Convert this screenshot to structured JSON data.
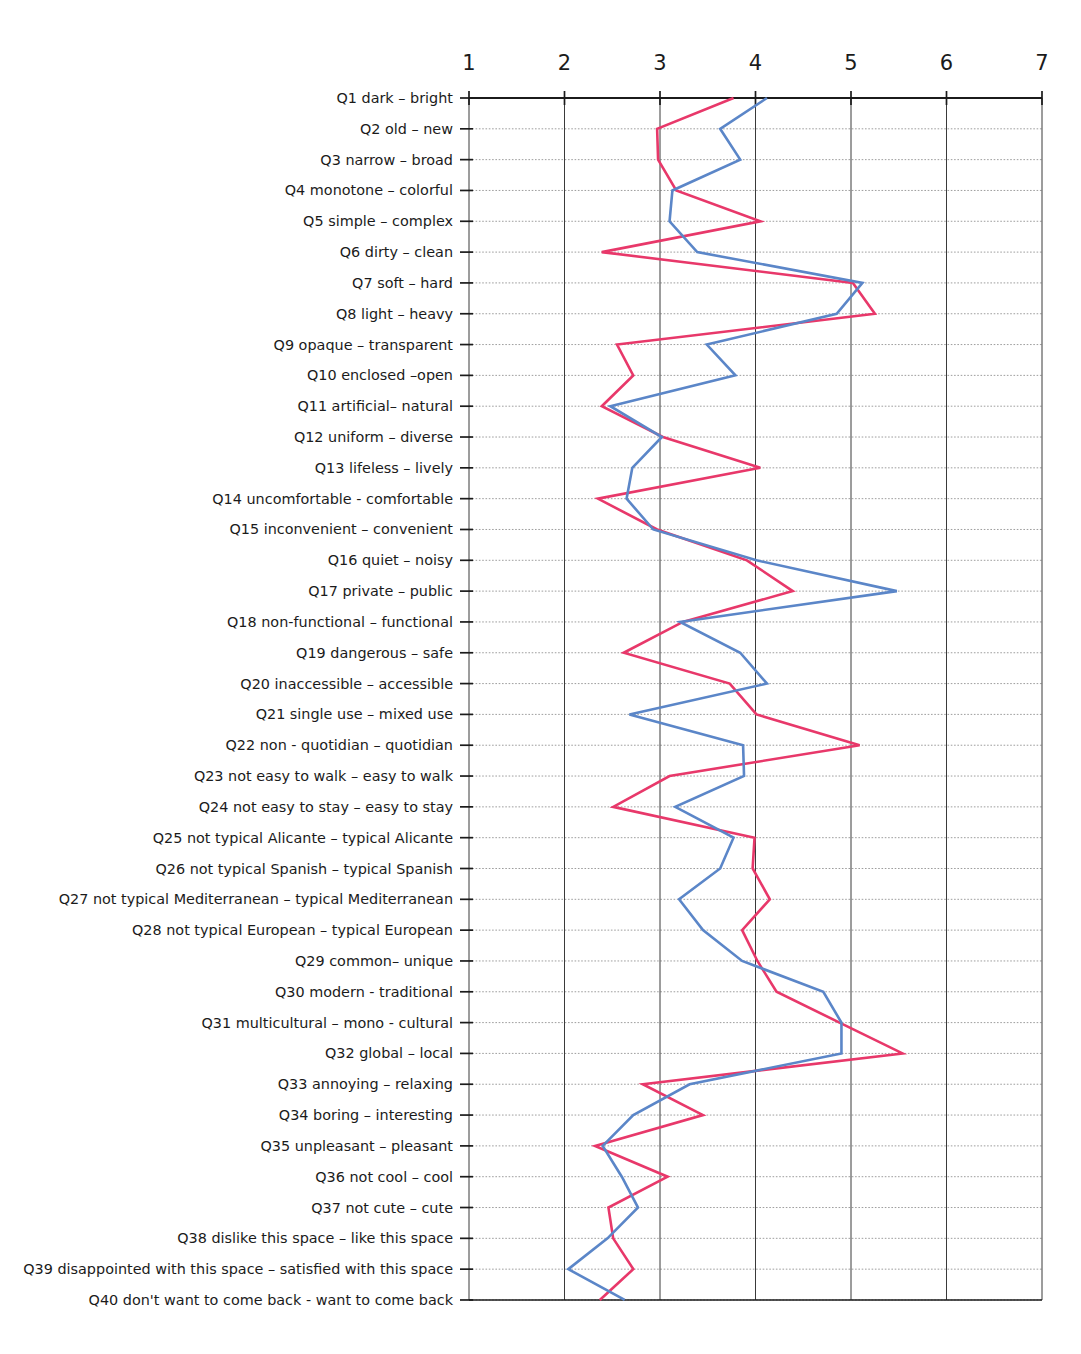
{
  "top_cropped_caption": "",
  "chart_data": {
    "type": "line",
    "orientation": "horizontal",
    "title": "",
    "subtitle": "",
    "xlabel": "",
    "ylabel": "",
    "xlim": [
      1,
      7
    ],
    "xticks": [
      "1",
      "2",
      "3",
      "4",
      "5",
      "6",
      "7"
    ],
    "grid": true,
    "legend_position": "top",
    "colors": {
      "series_1": "#e8386a",
      "series_2": "#5b86c8",
      "grid_major": "#3a3a3a",
      "grid_minor": "#8d8d8d",
      "axis": "#1b1b1b",
      "text": "#1b1b1b"
    },
    "categories": [
      "Q1 dark – bright",
      "Q2 old – new",
      "Q3 narrow  –  broad",
      "Q4 monotone –  colorful",
      "Q5 simple  –  complex",
      "Q6 dirty  – clean",
      "Q7 soft – hard",
      "Q8 light – heavy",
      "Q9 opaque – transparent",
      "Q10 enclosed –open",
      "Q11 artificial– natural",
      "Q12 uniform – diverse",
      "Q13 lifeless – lively",
      "Q14 uncomfortable - comfortable",
      "Q15 inconvenient – convenient",
      "Q16 quiet – noisy",
      "Q17 private – public",
      "Q18 non-functional –  functional",
      "Q19 dangerous – safe",
      "Q20 inaccessible – accessible",
      "Q21 single use  –  mixed use",
      "Q22 non - quotidian – quotidian",
      "Q23 not easy to walk – easy to walk",
      "Q24 not easy to stay – easy to stay",
      "Q25 not typical Alicante – typical Alicante",
      "Q26 not typical Spanish  – typical Spanish",
      "Q27 not typical Mediterranean – typical Mediterranean",
      "Q28 not typical European – typical European",
      "Q29 common–  unique",
      "Q30 modern - traditional",
      "Q31 multicultural – mono - cultural",
      "Q32 global – local",
      "Q33 annoying – relaxing",
      "Q34 boring – interesting",
      "Q35 unpleasant – pleasant",
      "Q36 not cool – cool",
      "Q37 not cute – cute",
      "Q38 dislike this space – like this space",
      "Q39 disappointed with this space – satisfied with this space",
      "Q40 don't want to come back - want to come back"
    ],
    "series": [
      {
        "name": "series-pink",
        "color": "#e8386a",
        "values": [
          3.77,
          2.97,
          2.98,
          3.17,
          4.05,
          2.39,
          5.02,
          5.25,
          2.55,
          2.72,
          2.39,
          3.03,
          4.05,
          2.35,
          2.97,
          3.91,
          4.39,
          3.24,
          2.62,
          3.73,
          4.01,
          5.09,
          3.1,
          2.51,
          3.99,
          3.97,
          4.15,
          3.86,
          4.02,
          4.22,
          4.88,
          5.54,
          2.82,
          3.45,
          2.32,
          3.08,
          2.46,
          2.51,
          2.72,
          2.37
        ]
      },
      {
        "name": "series-blue",
        "color": "#5b86c8",
        "values": [
          4.12,
          3.63,
          3.84,
          3.13,
          3.1,
          3.39,
          5.12,
          4.85,
          3.49,
          3.79,
          2.48,
          3.02,
          2.71,
          2.65,
          2.93,
          4.01,
          5.48,
          3.21,
          3.84,
          4.12,
          2.68,
          3.87,
          3.88,
          3.16,
          3.77,
          3.63,
          3.2,
          3.45,
          3.86,
          4.71,
          4.9,
          4.9,
          3.31,
          2.72,
          2.4,
          2.6,
          2.77,
          2.45,
          2.04,
          2.63
        ]
      }
    ]
  }
}
